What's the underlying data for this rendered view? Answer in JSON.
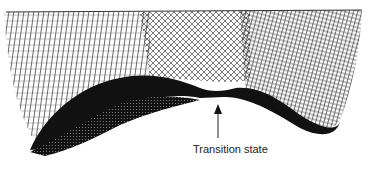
{
  "figure": {
    "type": "wireframe-surface",
    "mesh_color": "#1a1a1a",
    "background": "#ffffff"
  },
  "annotation": {
    "label": "Transition state",
    "arrow": "up"
  }
}
